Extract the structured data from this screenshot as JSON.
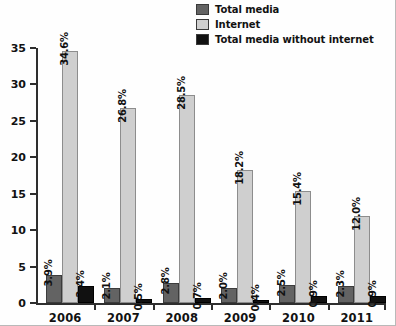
{
  "chart_data": {
    "type": "bar",
    "title": "",
    "subtitle": "",
    "xlabel": "",
    "ylabel": "",
    "categories": [
      "2006",
      "2007",
      "2008",
      "2009",
      "2010",
      "2011"
    ],
    "series": [
      {
        "name": "Total media",
        "color": "#636363",
        "values": [
          3.9,
          2.1,
          2.8,
          2.0,
          2.5,
          2.3
        ],
        "labels": [
          "3.9%",
          "2.1%",
          "2.8%",
          "2.0%",
          "2.5%",
          "2.3%"
        ]
      },
      {
        "name": "Internet",
        "color": "#cfcfcf",
        "values": [
          34.6,
          26.8,
          28.5,
          18.2,
          15.4,
          12.0
        ],
        "labels": [
          "34.6%",
          "26.8%",
          "28.5%",
          "18.2%",
          "15.4%",
          "12.0%"
        ]
      },
      {
        "name": "Total media without internet",
        "color": "#111111",
        "values": [
          2.4,
          0.5,
          0.7,
          0.4,
          0.9,
          0.9
        ],
        "labels": [
          "2.4%",
          "0.5%",
          "0.7%",
          "0.4%",
          "0.9%",
          "0.9%"
        ]
      }
    ],
    "ylim": [
      0,
      35
    ],
    "yticks": [
      0,
      5,
      10,
      15,
      20,
      25,
      30,
      35
    ],
    "ytick_labels": [
      "0",
      "5",
      "10",
      "15",
      "20",
      "25",
      "30",
      "35"
    ],
    "grid": false,
    "legend_position": "top-right"
  },
  "legend": {
    "items": [
      {
        "label": "Total media",
        "swatch": "#636363"
      },
      {
        "label": "Internet",
        "swatch": "#cfcfcf"
      },
      {
        "label": "Total media without internet",
        "swatch": "#111111"
      }
    ]
  }
}
